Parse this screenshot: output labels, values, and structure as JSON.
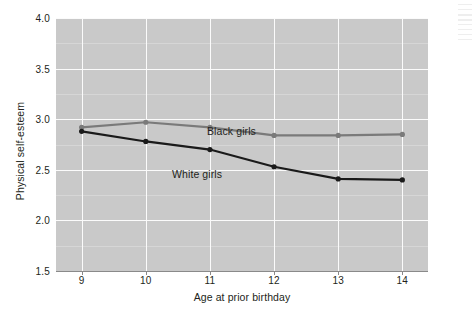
{
  "chart_data": {
    "type": "line",
    "title": "",
    "xlabel": "Age at prior birthday",
    "ylabel": "Physical self-esteem",
    "x": [
      9,
      10,
      11,
      12,
      13,
      14
    ],
    "xtick_labels": [
      "9",
      "10",
      "11",
      "12",
      "13",
      "14"
    ],
    "ytick_labels": [
      "1.5",
      "2.0",
      "2.5",
      "3.0",
      "3.5",
      "4.0"
    ],
    "yticks": [
      1.5,
      2.0,
      2.5,
      3.0,
      3.5,
      4.0
    ],
    "xlim": [
      8.6,
      14.4
    ],
    "ylim": [
      1.5,
      4.0
    ],
    "grid": "major and minor horizontal gridlines, vertical gridline at each age",
    "legend_position": "inline labels on plot",
    "plot_background": "#c9c9c9",
    "gridline_color": "#f7f7f7",
    "series": [
      {
        "name": "Black girls",
        "color": "#7a7a7a",
        "label_text": "Black girls",
        "values": [
          2.92,
          2.97,
          2.92,
          2.84,
          2.84,
          2.85
        ]
      },
      {
        "name": "White girls",
        "color": "#1a1a1a",
        "label_text": "White girls",
        "values": [
          2.88,
          2.78,
          2.7,
          2.53,
          2.41,
          2.4
        ]
      }
    ]
  },
  "axis": {
    "y_title": "Physical self-esteem",
    "x_title": "Age at prior birthday"
  }
}
